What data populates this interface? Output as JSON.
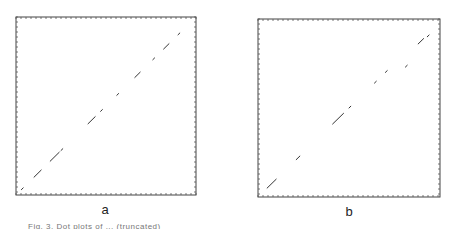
{
  "chart_data": [
    {
      "type": "scatter",
      "panel_label": "a",
      "title": "",
      "xlabel": "",
      "ylabel": "",
      "grid": false,
      "xlim": [
        0,
        1
      ],
      "ylim": [
        0,
        1
      ],
      "description": "Dot plot: short diagonal segments along the main diagonal",
      "segments": [
        {
          "x0": 0.03,
          "y0": 0.03,
          "x1": 0.04,
          "y1": 0.04
        },
        {
          "x0": 0.1,
          "y0": 0.1,
          "x1": 0.14,
          "y1": 0.14
        },
        {
          "x0": 0.19,
          "y0": 0.19,
          "x1": 0.24,
          "y1": 0.24
        },
        {
          "x0": 0.25,
          "y0": 0.25,
          "x1": 0.26,
          "y1": 0.26
        },
        {
          "x0": 0.4,
          "y0": 0.4,
          "x1": 0.44,
          "y1": 0.44
        },
        {
          "x0": 0.47,
          "y0": 0.47,
          "x1": 0.48,
          "y1": 0.48
        },
        {
          "x0": 0.56,
          "y0": 0.56,
          "x1": 0.57,
          "y1": 0.57
        },
        {
          "x0": 0.66,
          "y0": 0.66,
          "x1": 0.69,
          "y1": 0.69
        },
        {
          "x0": 0.76,
          "y0": 0.76,
          "x1": 0.77,
          "y1": 0.77
        },
        {
          "x0": 0.82,
          "y0": 0.82,
          "x1": 0.85,
          "y1": 0.85
        },
        {
          "x0": 0.9,
          "y0": 0.9,
          "x1": 0.91,
          "y1": 0.91
        }
      ]
    },
    {
      "type": "scatter",
      "panel_label": "b",
      "title": "",
      "xlabel": "",
      "ylabel": "",
      "grid": false,
      "xlim": [
        0,
        1
      ],
      "ylim": [
        0,
        1
      ],
      "description": "Dot plot: short diagonal segments along the main diagonal",
      "segments": [
        {
          "x0": 0.05,
          "y0": 0.05,
          "x1": 0.1,
          "y1": 0.1
        },
        {
          "x0": 0.21,
          "y0": 0.21,
          "x1": 0.23,
          "y1": 0.23
        },
        {
          "x0": 0.41,
          "y0": 0.41,
          "x1": 0.47,
          "y1": 0.47
        },
        {
          "x0": 0.5,
          "y0": 0.5,
          "x1": 0.51,
          "y1": 0.51
        },
        {
          "x0": 0.64,
          "y0": 0.64,
          "x1": 0.65,
          "y1": 0.65
        },
        {
          "x0": 0.7,
          "y0": 0.7,
          "x1": 0.71,
          "y1": 0.71
        },
        {
          "x0": 0.81,
          "y0": 0.73,
          "x1": 0.82,
          "y1": 0.74
        },
        {
          "x0": 0.88,
          "y0": 0.86,
          "x1": 0.91,
          "y1": 0.89
        },
        {
          "x0": 0.93,
          "y0": 0.9,
          "x1": 0.94,
          "y1": 0.91
        }
      ]
    }
  ],
  "labels": {
    "a": "a",
    "b": "b"
  },
  "caption": "Fig. 3. Dot plots of ... (truncated)"
}
